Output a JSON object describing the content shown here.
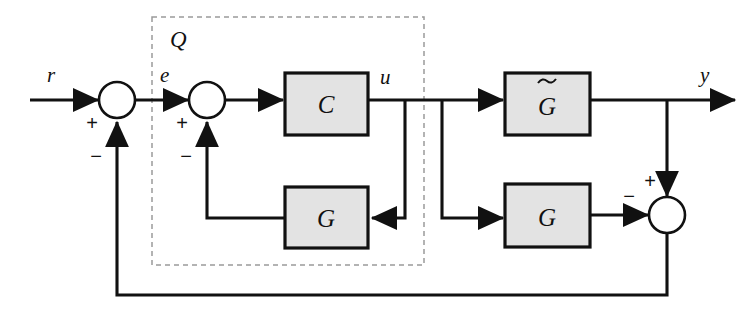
{
  "diagram": {
    "colors": {
      "block_fill": "#e3e3e3",
      "line": "#111111",
      "dashed_group": "#9a9a9a",
      "background": "#ffffff"
    },
    "blocks": [
      {
        "id": "controller",
        "label": "C",
        "tilde": false
      },
      {
        "id": "inner-model",
        "label": "G",
        "tilde": false
      },
      {
        "id": "plant",
        "label": "G",
        "tilde": true
      },
      {
        "id": "model",
        "label": "G",
        "tilde": false
      }
    ],
    "group": {
      "label": "Q"
    },
    "signals": [
      {
        "id": "reference",
        "label": "r"
      },
      {
        "id": "error",
        "label": "e"
      },
      {
        "id": "control",
        "label": "u"
      },
      {
        "id": "output",
        "label": "y"
      }
    ],
    "summing_junctions": [
      {
        "id": "outer-sum",
        "signs": [
          {
            "port": "left",
            "sign": "+"
          },
          {
            "port": "bottom",
            "sign": "−"
          }
        ]
      },
      {
        "id": "inner-sum",
        "signs": [
          {
            "port": "left",
            "sign": "+"
          },
          {
            "port": "bottom",
            "sign": "−"
          }
        ]
      },
      {
        "id": "mismatch-sum",
        "signs": [
          {
            "port": "top",
            "sign": "+"
          },
          {
            "port": "left",
            "sign": "−"
          }
        ]
      }
    ]
  }
}
